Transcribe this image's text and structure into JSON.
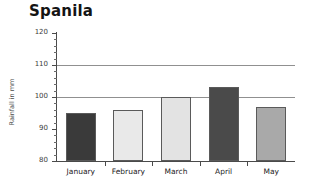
{
  "chart_data": {
    "type": "bar",
    "title": "Spanila",
    "xlabel": "",
    "ylabel": "Rainfall in mm",
    "categories": [
      "January",
      "February",
      "March",
      "April",
      "May"
    ],
    "values": [
      95,
      96,
      100,
      103,
      97
    ],
    "bar_colors": [
      "#3a3a3a",
      "#e9e9e9",
      "#e3e3e3",
      "#4a4a4a",
      "#a9a9a9"
    ],
    "ylim": [
      80,
      120
    ],
    "yticks": [
      80,
      90,
      100,
      110,
      120
    ],
    "ytick_labels": [
      "80",
      "90",
      "100",
      "110",
      "120"
    ],
    "minor_tick_step": 2,
    "gridlines": [
      100,
      110
    ],
    "grid": true,
    "legend": null
  }
}
